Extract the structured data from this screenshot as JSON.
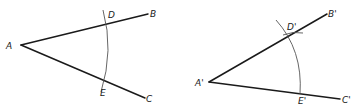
{
  "figures": [
    {
      "id": "original-angle",
      "labels": {
        "vertex": "A",
        "ray_end_1": "B",
        "ray_end_2": "C",
        "arc_point_1": "D",
        "arc_point_2": "E"
      }
    },
    {
      "id": "copied-angle",
      "labels": {
        "vertex": "A'",
        "ray_end_1": "B'",
        "ray_end_2": "C'",
        "arc_point_1": "D'",
        "arc_point_2": "E'"
      }
    }
  ],
  "colors": {
    "line": "#1a1a1a",
    "arc": "#555555",
    "background": "#ffffff"
  }
}
